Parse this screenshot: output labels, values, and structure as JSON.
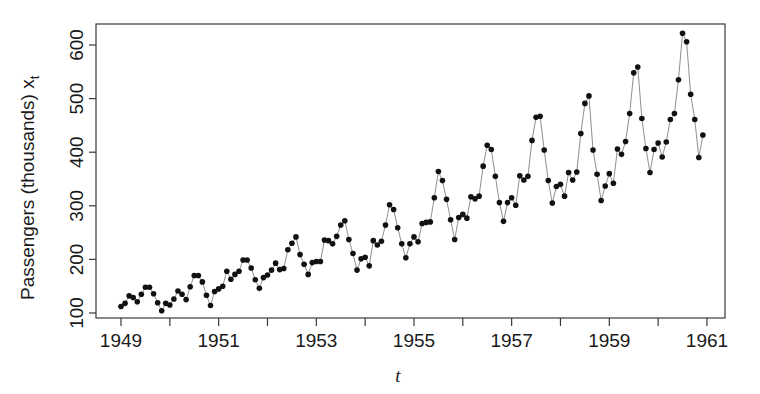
{
  "figure": {
    "background_color": "#ffffff",
    "foreground_color": "#1a1a1a",
    "point_color": "#111111",
    "axis_color": "#3a3a3a"
  },
  "chart_data": {
    "type": "scatter",
    "title": "",
    "subtitle": "",
    "xlabel": "t",
    "ylabel": "Passengers (thousands)  x",
    "ylabel_subscript": "t",
    "xlim": [
      1949.0,
      1961.0
    ],
    "ylim": [
      90,
      640
    ],
    "grid": false,
    "legend": null,
    "legend_position": "none",
    "marker": "filled-circle",
    "marker_size_px": 5.6,
    "connecting_line": true,
    "x_tick_values": [
      1949,
      1950,
      1951,
      1952,
      1953,
      1954,
      1955,
      1956,
      1957,
      1958,
      1959,
      1960,
      1961
    ],
    "x_tick_labels": [
      "1949",
      "",
      "1951",
      "",
      "1953",
      "",
      "1955",
      "",
      "1957",
      "",
      "1959",
      "",
      "1961"
    ],
    "y_tick_values": [
      100,
      200,
      300,
      400,
      500,
      600
    ],
    "y_tick_labels": [
      "100",
      "200",
      "300",
      "400",
      "500",
      "600"
    ],
    "series": [
      {
        "name": "AirPassengers",
        "x": [
          1949.0,
          1949.0833,
          1949.1667,
          1949.25,
          1949.3333,
          1949.4167,
          1949.5,
          1949.5833,
          1949.6667,
          1949.75,
          1949.8333,
          1949.9167,
          1950.0,
          1950.0833,
          1950.1667,
          1950.25,
          1950.3333,
          1950.4167,
          1950.5,
          1950.5833,
          1950.6667,
          1950.75,
          1950.8333,
          1950.9167,
          1951.0,
          1951.0833,
          1951.1667,
          1951.25,
          1951.3333,
          1951.4167,
          1951.5,
          1951.5833,
          1951.6667,
          1951.75,
          1951.8333,
          1951.9167,
          1952.0,
          1952.0833,
          1952.1667,
          1952.25,
          1952.3333,
          1952.4167,
          1952.5,
          1952.5833,
          1952.6667,
          1952.75,
          1952.8333,
          1952.9167,
          1953.0,
          1953.0833,
          1953.1667,
          1953.25,
          1953.3333,
          1953.4167,
          1953.5,
          1953.5833,
          1953.6667,
          1953.75,
          1953.8333,
          1953.9167,
          1954.0,
          1954.0833,
          1954.1667,
          1954.25,
          1954.3333,
          1954.4167,
          1954.5,
          1954.5833,
          1954.6667,
          1954.75,
          1954.8333,
          1954.9167,
          1955.0,
          1955.0833,
          1955.1667,
          1955.25,
          1955.3333,
          1955.4167,
          1955.5,
          1955.5833,
          1955.6667,
          1955.75,
          1955.8333,
          1955.9167,
          1956.0,
          1956.0833,
          1956.1667,
          1956.25,
          1956.3333,
          1956.4167,
          1956.5,
          1956.5833,
          1956.6667,
          1956.75,
          1956.8333,
          1956.9167,
          1957.0,
          1957.0833,
          1957.1667,
          1957.25,
          1957.3333,
          1957.4167,
          1957.5,
          1957.5833,
          1957.6667,
          1957.75,
          1957.8333,
          1957.9167,
          1958.0,
          1958.0833,
          1958.1667,
          1958.25,
          1958.3333,
          1958.4167,
          1958.5,
          1958.5833,
          1958.6667,
          1958.75,
          1958.8333,
          1958.9167,
          1959.0,
          1959.0833,
          1959.1667,
          1959.25,
          1959.3333,
          1959.4167,
          1959.5,
          1959.5833,
          1959.6667,
          1959.75,
          1959.8333,
          1959.9167,
          1960.0,
          1960.0833,
          1960.1667,
          1960.25,
          1960.3333,
          1960.4167,
          1960.5,
          1960.5833,
          1960.6667,
          1960.75,
          1960.8333,
          1960.9167
        ],
        "values": [
          112,
          118,
          132,
          129,
          121,
          135,
          148,
          148,
          136,
          119,
          104,
          118,
          115,
          126,
          141,
          135,
          125,
          149,
          170,
          170,
          158,
          133,
          114,
          140,
          145,
          150,
          178,
          163,
          172,
          178,
          199,
          199,
          184,
          162,
          146,
          166,
          171,
          180,
          193,
          181,
          183,
          218,
          230,
          242,
          209,
          191,
          172,
          194,
          196,
          196,
          236,
          235,
          229,
          243,
          264,
          272,
          237,
          211,
          180,
          201,
          204,
          188,
          235,
          227,
          234,
          264,
          302,
          293,
          259,
          229,
          203,
          229,
          242,
          233,
          267,
          269,
          270,
          315,
          364,
          347,
          312,
          274,
          237,
          278,
          284,
          277,
          317,
          313,
          318,
          374,
          413,
          405,
          355,
          306,
          271,
          306,
          315,
          301,
          356,
          348,
          355,
          422,
          465,
          467,
          404,
          347,
          305,
          336,
          340,
          318,
          362,
          348,
          363,
          435,
          491,
          505,
          404,
          359,
          310,
          337,
          360,
          342,
          406,
          396,
          420,
          472,
          548,
          559,
          463,
          407,
          362,
          405,
          417,
          391,
          419,
          461,
          472,
          535,
          622,
          606,
          508,
          461,
          390,
          432
        ]
      }
    ]
  },
  "axes": {
    "plot_box": {
      "left": 96,
      "top": 24,
      "right": 725,
      "bottom": 318
    },
    "x_pixel_for_1949": 121,
    "x_pixels_per_year": 48.83,
    "y_pixel_for_100": 313,
    "y_pixels_per_100": 53.6
  }
}
